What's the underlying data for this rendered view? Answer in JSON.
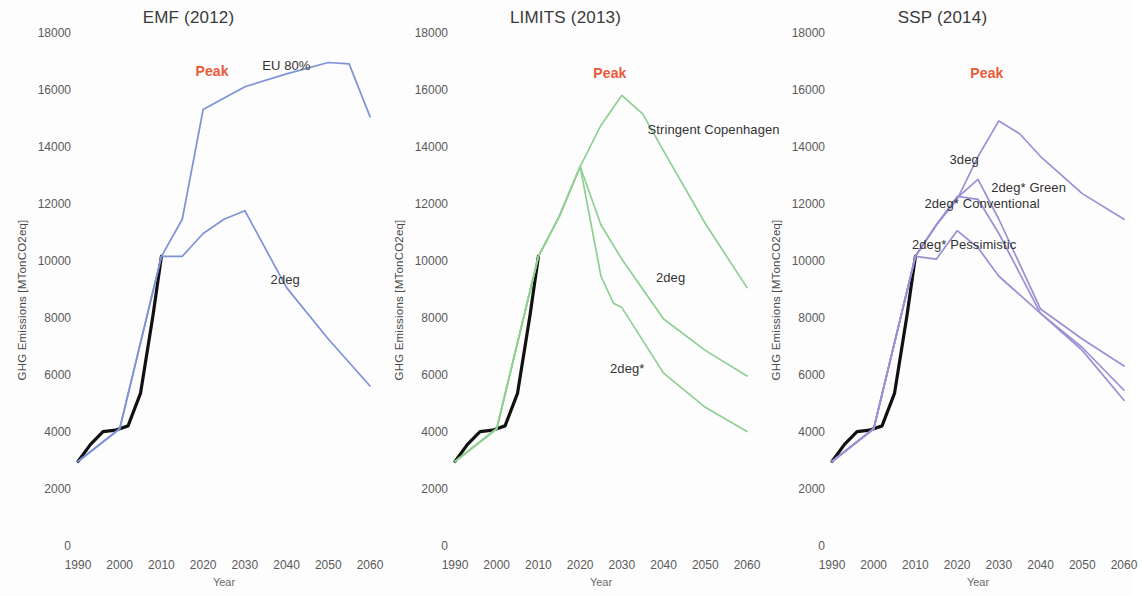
{
  "figure": {
    "width": 1131,
    "height": 596,
    "background": "#ffffff"
  },
  "axes": {
    "ylabel": "GHG Emissions [MTonCO2eq]",
    "xlabel": "Year",
    "yticks": [
      "0",
      "2000",
      "4000",
      "6000",
      "8000",
      "10000",
      "12000",
      "14000",
      "16000",
      "18000"
    ],
    "xticks": [
      "1990",
      "2000",
      "2010",
      "2020",
      "2030",
      "2040",
      "2050",
      "2060"
    ],
    "ylim": [
      0,
      18000
    ],
    "xlim": [
      1990,
      2060
    ]
  },
  "colors": {
    "historical": "#111111",
    "emf": "#7d93d6",
    "limits": "#90cf92",
    "ssp": "#9d8fd4",
    "peak_label": "#e8593a",
    "text": "#3c3c3c"
  },
  "chart_data": {
    "type": "line",
    "xlabel": "Year",
    "ylabel": "GHG Emissions [MTonCO2eq]",
    "xlim": [
      1990,
      2060
    ],
    "ylim": [
      0,
      18000
    ],
    "grid": false,
    "legend_position": "inline-annotations",
    "panels": [
      {
        "title": "EMF (2012)",
        "color": "#7d93d6",
        "annotations": [
          {
            "text": "Peak",
            "x": 2022,
            "y": 16650,
            "color": "#e8593a"
          },
          {
            "text": "EU 80%",
            "x": 2038,
            "y": 16850,
            "color": "#333333"
          },
          {
            "text": "2deg",
            "y": 9350,
            "x": 2040,
            "color": "#333333"
          }
        ],
        "series": [
          {
            "name": "Historical",
            "color": "#111111",
            "x": [
              1990,
              1993,
              1996,
              1999,
              2002,
              2005,
              2008,
              2010
            ],
            "values": [
              3000,
              3600,
              4050,
              4100,
              4250,
              5400,
              8150,
              10200
            ]
          },
          {
            "name": "EU 80%",
            "color": "#7d93d6",
            "x": [
              1990,
              2000,
              2010,
              2015,
              2020,
              2030,
              2040,
              2050,
              2055,
              2060
            ],
            "values": [
              3000,
              4150,
              10200,
              11500,
              15350,
              16150,
              16600,
              17000,
              16950,
              15100
            ]
          },
          {
            "name": "2deg",
            "color": "#7d93d6",
            "x": [
              1990,
              2000,
              2010,
              2015,
              2020,
              2025,
              2030,
              2040,
              2050,
              2060
            ],
            "values": [
              3000,
              4150,
              10200,
              10200,
              11000,
              11500,
              11800,
              9100,
              7300,
              5650
            ]
          }
        ]
      },
      {
        "title": "LIMITS (2013)",
        "color": "#90cf92",
        "annotations": [
          {
            "text": "Peak",
            "x": 2027,
            "y": 16600,
            "color": "#e8593a"
          },
          {
            "text": "Stringent Copenhagen",
            "x": 2040,
            "y": 14600,
            "color": "#333333"
          },
          {
            "text": "2deg",
            "x": 2042,
            "y": 9400,
            "color": "#333333"
          },
          {
            "text": "2deg*",
            "x": 2031,
            "y": 6200,
            "color": "#333333"
          }
        ],
        "series": [
          {
            "name": "Historical",
            "color": "#111111",
            "x": [
              1990,
              1993,
              1996,
              1999,
              2002,
              2005,
              2008,
              2010
            ],
            "values": [
              3000,
              3600,
              4050,
              4100,
              4250,
              5400,
              8150,
              10200
            ]
          },
          {
            "name": "Stringent Copenhagen",
            "color": "#90cf92",
            "x": [
              1990,
              2000,
              2010,
              2015,
              2020,
              2025,
              2030,
              2035,
              2040,
              2050,
              2060
            ],
            "values": [
              3000,
              4150,
              10200,
              11600,
              13350,
              14800,
              15850,
              15200,
              13900,
              11350,
              9100
            ]
          },
          {
            "name": "2deg",
            "color": "#90cf92",
            "x": [
              1990,
              2000,
              2010,
              2015,
              2020,
              2025,
              2030,
              2040,
              2050,
              2060
            ],
            "values": [
              3000,
              4150,
              10200,
              11600,
              13350,
              11300,
              10100,
              8000,
              6900,
              6000
            ]
          },
          {
            "name": "2deg*",
            "color": "#90cf92",
            "x": [
              1990,
              2000,
              2010,
              2015,
              2020,
              2025,
              2028,
              2030,
              2040,
              2050,
              2060
            ],
            "values": [
              3000,
              4150,
              10200,
              11600,
              13350,
              9500,
              8550,
              8400,
              6100,
              4900,
              4050
            ]
          }
        ]
      },
      {
        "title": "SSP (2014)",
        "color": "#9d8fd4",
        "annotations": [
          {
            "text": "Peak",
            "x": 2027,
            "y": 16600,
            "color": "#e8593a"
          },
          {
            "text": "3deg",
            "x": 2022,
            "y": 13550,
            "color": "#333333"
          },
          {
            "text": "2deg* Green",
            "x": 2032,
            "y": 12550,
            "color": "#333333"
          },
          {
            "text": "2deg* Conventional",
            "x": 2016,
            "y": 12000,
            "color": "#333333"
          },
          {
            "text": "2deg* Pessimistic",
            "x": 2013,
            "y": 10550,
            "color": "#333333"
          }
        ],
        "series": [
          {
            "name": "Historical",
            "color": "#111111",
            "x": [
              1990,
              1993,
              1996,
              1999,
              2002,
              2005,
              2008,
              2010
            ],
            "values": [
              3000,
              3600,
              4050,
              4100,
              4250,
              5400,
              8150,
              10200
            ]
          },
          {
            "name": "3deg",
            "color": "#9d8fd4",
            "x": [
              1990,
              2000,
              2010,
              2015,
              2020,
              2025,
              2030,
              2035,
              2040,
              2050,
              2060
            ],
            "values": [
              3000,
              4150,
              10200,
              11300,
              12200,
              13700,
              14950,
              14500,
              13700,
              12400,
              11500
            ]
          },
          {
            "name": "2deg* Green",
            "color": "#9d8fd4",
            "x": [
              1990,
              2000,
              2010,
              2015,
              2020,
              2025,
              2030,
              2040,
              2050,
              2060
            ],
            "values": [
              3000,
              4150,
              10200,
              11300,
              12250,
              12900,
              11500,
              8350,
              7300,
              6350
            ]
          },
          {
            "name": "2deg* Conventional",
            "color": "#9d8fd4",
            "x": [
              1990,
              2000,
              2010,
              2015,
              2020,
              2025,
              2030,
              2040,
              2050,
              2060
            ],
            "values": [
              3000,
              4150,
              10200,
              11300,
              12300,
              12200,
              11000,
              8200,
              7000,
              5500
            ]
          },
          {
            "name": "2deg* Pessimistic",
            "color": "#9d8fd4",
            "x": [
              1990,
              2000,
              2010,
              2015,
              2020,
              2025,
              2030,
              2040,
              2050,
              2060
            ],
            "values": [
              3000,
              4150,
              10200,
              10100,
              11100,
              10500,
              9500,
              8200,
              6900,
              5150
            ]
          }
        ]
      }
    ]
  }
}
